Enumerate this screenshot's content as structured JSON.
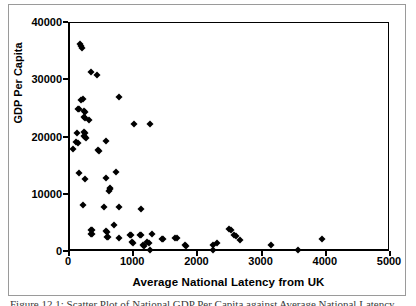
{
  "chart_data": {
    "type": "scatter",
    "title": "",
    "xlabel": "Average National Latency from UK",
    "ylabel": "GDP Per Capita",
    "xlim": [
      0,
      5000
    ],
    "ylim": [
      0,
      40000
    ],
    "xticks": [
      "0",
      "1000",
      "2000",
      "3000",
      "4000",
      "5000"
    ],
    "yticks": [
      "0",
      "10000",
      "20000",
      "30000",
      "40000"
    ],
    "grid": false,
    "legend": "none",
    "marker": "filled-diamond",
    "marker_color": "#000000",
    "points": [
      [
        150,
        36400
      ],
      [
        165,
        36000
      ],
      [
        180,
        35700
      ],
      [
        330,
        31400
      ],
      [
        420,
        31000
      ],
      [
        175,
        26600
      ],
      [
        195,
        26700
      ],
      [
        760,
        27100
      ],
      [
        120,
        24900
      ],
      [
        140,
        25000
      ],
      [
        215,
        24600
      ],
      [
        230,
        24500
      ],
      [
        225,
        23500
      ],
      [
        240,
        23400
      ],
      [
        300,
        23000
      ],
      [
        1000,
        22300
      ],
      [
        1250,
        22300
      ],
      [
        110,
        20700
      ],
      [
        215,
        20900
      ],
      [
        230,
        20800
      ],
      [
        225,
        20200
      ],
      [
        240,
        20100
      ],
      [
        250,
        20000
      ],
      [
        100,
        19200
      ],
      [
        120,
        19000
      ],
      [
        560,
        19400
      ],
      [
        50,
        18000
      ],
      [
        440,
        17800
      ],
      [
        455,
        17700
      ],
      [
        140,
        13800
      ],
      [
        720,
        14000
      ],
      [
        555,
        13000
      ],
      [
        230,
        12700
      ],
      [
        620,
        11200
      ],
      [
        630,
        11000
      ],
      [
        600,
        10600
      ],
      [
        205,
        8200
      ],
      [
        530,
        7900
      ],
      [
        770,
        7800
      ],
      [
        1100,
        7500
      ],
      [
        690,
        4700
      ],
      [
        330,
        3900
      ],
      [
        340,
        3800
      ],
      [
        555,
        3700
      ],
      [
        575,
        3500
      ],
      [
        2480,
        4000
      ],
      [
        2500,
        3900
      ],
      [
        330,
        3200
      ],
      [
        345,
        3100
      ],
      [
        575,
        2700
      ],
      [
        590,
        2600
      ],
      [
        760,
        2500
      ],
      [
        930,
        3000
      ],
      [
        945,
        2900
      ],
      [
        1090,
        3000
      ],
      [
        1110,
        2900
      ],
      [
        1275,
        3100
      ],
      [
        1430,
        2300
      ],
      [
        1445,
        2200
      ],
      [
        1640,
        2500
      ],
      [
        1660,
        2400
      ],
      [
        2560,
        2900
      ],
      [
        2590,
        2800
      ],
      [
        2650,
        2100
      ],
      [
        3930,
        2200
      ],
      [
        1200,
        1700
      ],
      [
        1230,
        1600
      ],
      [
        960,
        1700
      ],
      [
        975,
        1600
      ],
      [
        1130,
        1200
      ],
      [
        1150,
        1100
      ],
      [
        1790,
        1200
      ],
      [
        1810,
        1100
      ],
      [
        2220,
        1300
      ],
      [
        2290,
        1600
      ],
      [
        3130,
        1200
      ],
      [
        1240,
        300
      ],
      [
        2230,
        400
      ],
      [
        3550,
        300
      ]
    ]
  },
  "axes": {
    "y_title": "GDP Per Capita",
    "x_title": "Average National Latency from UK"
  },
  "caption": {
    "text": "Figure 12.1: Scatter Plot of National GDP Per Capita against Average National Latency"
  }
}
